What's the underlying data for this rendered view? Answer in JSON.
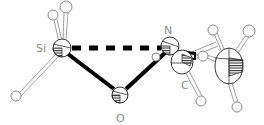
{
  "diagram": {
    "type": "ortep-molecular-structure",
    "atoms": [
      {
        "id": "Si",
        "label": "Si",
        "x": 62,
        "y": 48,
        "r": 9
      },
      {
        "id": "O",
        "label": "O",
        "x": 120,
        "y": 95,
        "r": 8
      },
      {
        "id": "N",
        "label": "N",
        "x": 170,
        "y": 46,
        "r": 9
      },
      {
        "id": "C1",
        "label": "C",
        "x": 182,
        "y": 62,
        "rx": 11,
        "ry": 12
      },
      {
        "id": "C2",
        "label": "",
        "x": 229,
        "y": 66,
        "rx": 14,
        "ry": 18
      }
    ],
    "hydrogens": [
      {
        "id": "H1",
        "x": 53,
        "y": 15,
        "r": 5
      },
      {
        "id": "H2",
        "x": 66,
        "y": 7,
        "r": 6
      },
      {
        "id": "H3",
        "x": 16,
        "y": 96,
        "r": 5
      },
      {
        "id": "H4",
        "x": 213,
        "y": 30,
        "r": 5
      },
      {
        "id": "H5",
        "x": 249,
        "y": 31,
        "r": 6
      },
      {
        "id": "H6",
        "x": 203,
        "y": 56,
        "r": 5
      },
      {
        "id": "H7",
        "x": 201,
        "y": 101,
        "r": 5
      },
      {
        "id": "H8",
        "x": 237,
        "y": 107,
        "r": 5
      },
      {
        "id": "H9",
        "x": 156,
        "y": 57,
        "r": 5
      }
    ],
    "bonds": [
      {
        "from": "Si",
        "to": "O",
        "style": "bold"
      },
      {
        "from": "O",
        "to": "N",
        "style": "bold"
      },
      {
        "from": "N",
        "to": "C1",
        "style": "bold"
      },
      {
        "from": "Si",
        "to": "N",
        "style": "dashed"
      }
    ],
    "labels": {
      "si": "Si",
      "o": "O",
      "n": "N",
      "c": "C"
    },
    "colors": {
      "bond": "#000000",
      "hbond": "#9a9a9a",
      "label": "#8a8a8a",
      "atom_stroke": "#555555"
    }
  }
}
